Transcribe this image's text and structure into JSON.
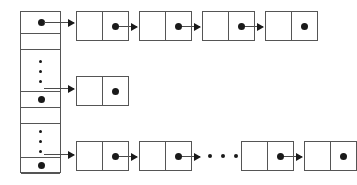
{
  "diagram": {
    "type": "hash-table-with-separate-chaining",
    "title": "",
    "bucket_array": {
      "name": "bucket-array",
      "left": 20,
      "top": 11,
      "width": 41,
      "height": 162,
      "cells": [
        {
          "kind": "pointer",
          "top": 0,
          "height": 22,
          "has_dot": true,
          "divider": true,
          "label": "bucket-pointer-1"
        },
        {
          "kind": "empty",
          "top": 22,
          "height": 16,
          "has_dot": false,
          "divider": true,
          "label": "bucket-empty-1"
        },
        {
          "kind": "ellipsis",
          "top": 38,
          "height": 42,
          "has_dot": false,
          "divider": true,
          "label": "bucket-ellipsis-1"
        },
        {
          "kind": "pointer",
          "top": 80,
          "height": 16,
          "has_dot": true,
          "divider": true,
          "label": "bucket-pointer-2"
        },
        {
          "kind": "empty",
          "top": 96,
          "height": 16,
          "has_dot": false,
          "divider": true,
          "label": "bucket-empty-2"
        },
        {
          "kind": "ellipsis",
          "top": 112,
          "height": 34,
          "has_dot": false,
          "divider": true,
          "label": "bucket-ellipsis-2"
        },
        {
          "kind": "pointer",
          "top": 146,
          "height": 16,
          "has_dot": true,
          "divider": true,
          "label": "bucket-pointer-3"
        },
        {
          "kind": "empty",
          "top": 162,
          "height": 16,
          "has_dot": false,
          "divider": false,
          "label": "bucket-empty-3"
        }
      ]
    },
    "chains": [
      {
        "name": "chain-row-1",
        "row_top": 11,
        "nodes": [
          {
            "left": 76,
            "key_dot": false,
            "next_dot": true,
            "label": "node-1-1"
          },
          {
            "left": 139,
            "key_dot": false,
            "next_dot": true,
            "label": "node-1-2"
          },
          {
            "left": 202,
            "key_dot": false,
            "next_dot": true,
            "label": "node-1-3"
          },
          {
            "left": 265,
            "key_dot": false,
            "next_dot": true,
            "label": "node-1-4"
          }
        ],
        "arrows": [
          {
            "x": 44,
            "y": 22,
            "width": 30,
            "label": "arrow-array-to-node-1-1"
          },
          {
            "x": 116,
            "y": 26,
            "width": 21,
            "label": "arrow-node-1-1-to-1-2"
          },
          {
            "x": 179,
            "y": 26,
            "width": 21,
            "label": "arrow-node-1-2-to-1-3"
          },
          {
            "x": 242,
            "y": 26,
            "width": 21,
            "label": "arrow-node-1-3-to-1-4"
          }
        ],
        "ellipsis": null
      },
      {
        "name": "chain-row-2",
        "row_top": 76,
        "nodes": [
          {
            "left": 76,
            "key_dot": false,
            "next_dot": true,
            "label": "node-2-1"
          }
        ],
        "arrows": [
          {
            "x": 44,
            "y": 88,
            "width": 30,
            "label": "arrow-array-to-node-2-1"
          }
        ],
        "ellipsis": null
      },
      {
        "name": "chain-row-3",
        "row_top": 141,
        "nodes": [
          {
            "left": 76,
            "key_dot": false,
            "next_dot": true,
            "label": "node-3-1"
          },
          {
            "left": 139,
            "key_dot": false,
            "next_dot": true,
            "label": "node-3-2"
          },
          {
            "left": 241,
            "key_dot": false,
            "next_dot": true,
            "label": "node-3-3"
          },
          {
            "left": 304,
            "key_dot": false,
            "next_dot": true,
            "label": "node-3-4"
          }
        ],
        "arrows": [
          {
            "x": 44,
            "y": 154,
            "width": 30,
            "label": "arrow-array-to-node-3-1"
          },
          {
            "x": 116,
            "y": 156,
            "width": 21,
            "label": "arrow-node-3-1-to-3-2"
          },
          {
            "x": 179,
            "y": 156,
            "width": 21,
            "label": "arrow-node-3-2-to-ellipsis"
          },
          {
            "x": 281,
            "y": 156,
            "width": 21,
            "label": "arrow-node-3-3-to-3-4"
          }
        ],
        "ellipsis": {
          "x": 208,
          "y": 154,
          "dots": 3,
          "label": "chain-row-3-ellipsis"
        }
      }
    ],
    "colors": {
      "stroke": "#555555",
      "dot": "#1a1a1a",
      "arrow": "#4a4a4a",
      "background": "#ffffff"
    }
  }
}
